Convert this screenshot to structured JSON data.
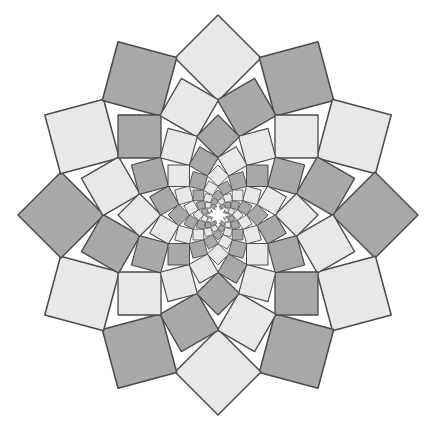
{
  "canvas": {
    "width": 437,
    "height": 433,
    "background": "#ffffff"
  },
  "rosette": {
    "center": [
      218,
      215
    ],
    "symmetry": 12,
    "ring_count": 10,
    "outer_center_radius": 157,
    "outer_half_diagonal": 43,
    "ring_scale": 0.707,
    "ring_angle_step_deg": 15,
    "start_angle_deg": 0,
    "first_square_color": "light",
    "colors": {
      "light": "#e8e8e8",
      "dark": "#a8a8a8",
      "stroke": "#4a4a4a",
      "center_star": "#ffffff"
    },
    "stroke_width": 1.2
  }
}
